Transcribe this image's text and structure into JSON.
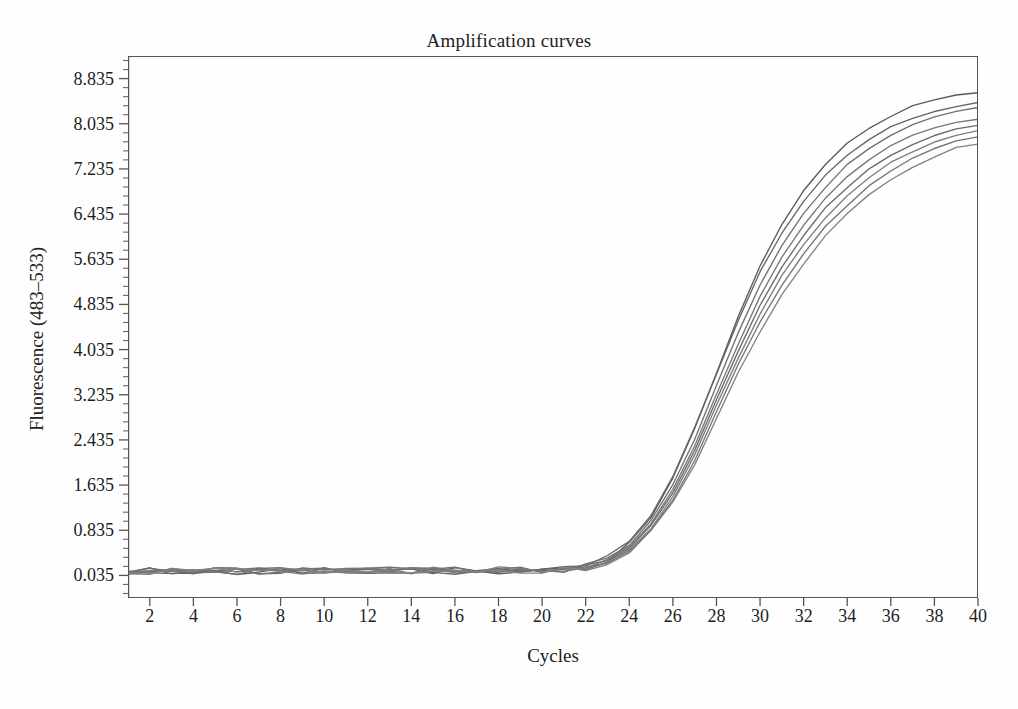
{
  "chart_data": {
    "type": "line",
    "title": "Amplification curves",
    "xlabel": "Cycles",
    "ylabel": "Fluorescence (483–533)",
    "xlim": [
      1,
      40
    ],
    "ylim": [
      -0.365,
      9.235
    ],
    "grid": false,
    "legend": "none",
    "x_ticks": [
      2,
      4,
      6,
      8,
      10,
      12,
      14,
      16,
      18,
      20,
      22,
      24,
      26,
      28,
      30,
      32,
      34,
      36,
      38,
      40
    ],
    "x_tick_labels": [
      "2",
      "4",
      "6",
      "8",
      "10",
      "12",
      "14",
      "16",
      "18",
      "20",
      "22",
      "24",
      "26",
      "28",
      "30",
      "32",
      "34",
      "36",
      "38",
      "40"
    ],
    "x_minor_tick_step": 1,
    "y_ticks": [
      0.035,
      0.835,
      1.635,
      2.435,
      3.235,
      4.035,
      4.835,
      5.635,
      6.435,
      7.235,
      8.035,
      8.835
    ],
    "y_tick_labels": [
      "0.035",
      "0.835",
      "1.635",
      "2.435",
      "3.235",
      "4.035",
      "4.835",
      "5.635",
      "6.435",
      "7.235",
      "8.035",
      "8.835"
    ],
    "y_minor_ticks_per_interval": 5,
    "x": [
      1,
      2,
      3,
      4,
      5,
      6,
      7,
      8,
      9,
      10,
      11,
      12,
      13,
      14,
      15,
      16,
      17,
      18,
      19,
      20,
      21,
      22,
      23,
      24,
      25,
      26,
      27,
      28,
      29,
      30,
      31,
      32,
      33,
      34,
      35,
      36,
      37,
      38,
      39,
      40
    ],
    "series_color": "#6d6d6d",
    "series": [
      {
        "name": "sample-1",
        "color": "#5a5a5a",
        "values": [
          0.12,
          0.11,
          0.1,
          0.12,
          0.11,
          0.09,
          0.12,
          0.13,
          0.11,
          0.1,
          0.12,
          0.13,
          0.11,
          0.12,
          0.1,
          0.13,
          0.12,
          0.11,
          0.13,
          0.12,
          0.14,
          0.18,
          0.32,
          0.62,
          1.08,
          1.75,
          2.62,
          3.62,
          4.62,
          5.52,
          6.25,
          6.85,
          7.32,
          7.68,
          7.96,
          8.18,
          8.34,
          8.47,
          8.56,
          8.6
        ]
      },
      {
        "name": "sample-2",
        "color": "#666666",
        "values": [
          0.11,
          0.12,
          0.11,
          0.1,
          0.12,
          0.11,
          0.1,
          0.12,
          0.12,
          0.11,
          0.13,
          0.11,
          0.12,
          0.13,
          0.11,
          0.12,
          0.13,
          0.12,
          0.11,
          0.13,
          0.15,
          0.2,
          0.34,
          0.64,
          1.1,
          1.78,
          2.64,
          3.6,
          4.55,
          5.4,
          6.08,
          6.66,
          7.12,
          7.48,
          7.76,
          7.98,
          8.14,
          8.26,
          8.35,
          8.4
        ]
      },
      {
        "name": "sample-3",
        "color": "#707070",
        "values": [
          0.1,
          0.11,
          0.12,
          0.11,
          0.1,
          0.12,
          0.11,
          0.11,
          0.13,
          0.12,
          0.11,
          0.12,
          0.13,
          0.11,
          0.12,
          0.13,
          0.11,
          0.13,
          0.12,
          0.12,
          0.14,
          0.19,
          0.31,
          0.58,
          1.0,
          1.64,
          2.46,
          3.4,
          4.34,
          5.18,
          5.88,
          6.45,
          6.92,
          7.3,
          7.6,
          7.84,
          8.02,
          8.16,
          8.26,
          8.32
        ]
      },
      {
        "name": "sample-4",
        "color": "#787878",
        "values": [
          0.12,
          0.1,
          0.11,
          0.12,
          0.11,
          0.13,
          0.12,
          0.1,
          0.12,
          0.13,
          0.12,
          0.11,
          0.12,
          0.12,
          0.13,
          0.11,
          0.12,
          0.12,
          0.13,
          0.12,
          0.14,
          0.18,
          0.3,
          0.56,
          0.96,
          1.56,
          2.34,
          3.24,
          4.14,
          4.96,
          5.66,
          6.24,
          6.72,
          7.1,
          7.4,
          7.64,
          7.82,
          7.96,
          8.06,
          8.12
        ]
      },
      {
        "name": "sample-5",
        "color": "#6a6a6a",
        "values": [
          0.11,
          0.12,
          0.1,
          0.11,
          0.13,
          0.11,
          0.12,
          0.12,
          0.1,
          0.12,
          0.13,
          0.12,
          0.11,
          0.13,
          0.12,
          0.11,
          0.13,
          0.12,
          0.12,
          0.13,
          0.15,
          0.19,
          0.29,
          0.54,
          0.92,
          1.5,
          2.26,
          3.14,
          4.02,
          4.82,
          5.5,
          6.06,
          6.54,
          6.92,
          7.24,
          7.48,
          7.68,
          7.82,
          7.94,
          8.02
        ]
      },
      {
        "name": "sample-6",
        "color": "#7e7e7e",
        "values": [
          0.12,
          0.11,
          0.12,
          0.1,
          0.12,
          0.12,
          0.11,
          0.13,
          0.11,
          0.12,
          0.11,
          0.13,
          0.12,
          0.11,
          0.13,
          0.12,
          0.11,
          0.13,
          0.12,
          0.13,
          0.14,
          0.18,
          0.28,
          0.52,
          0.88,
          1.44,
          2.18,
          3.04,
          3.9,
          4.68,
          5.34,
          5.9,
          6.38,
          6.76,
          7.08,
          7.34,
          7.54,
          7.7,
          7.82,
          7.9
        ]
      },
      {
        "name": "sample-7",
        "color": "#747474",
        "values": [
          0.1,
          0.12,
          0.11,
          0.13,
          0.11,
          0.1,
          0.13,
          0.11,
          0.12,
          0.13,
          0.12,
          0.12,
          0.11,
          0.12,
          0.12,
          0.13,
          0.12,
          0.11,
          0.13,
          0.12,
          0.13,
          0.17,
          0.27,
          0.5,
          0.85,
          1.38,
          2.08,
          2.92,
          3.76,
          4.52,
          5.18,
          5.74,
          6.22,
          6.6,
          6.94,
          7.2,
          7.42,
          7.58,
          7.72,
          7.8
        ]
      },
      {
        "name": "sample-8",
        "color": "#828282",
        "values": [
          0.11,
          0.11,
          0.12,
          0.11,
          0.12,
          0.12,
          0.11,
          0.12,
          0.13,
          0.11,
          0.12,
          0.12,
          0.13,
          0.12,
          0.11,
          0.12,
          0.13,
          0.12,
          0.12,
          0.12,
          0.13,
          0.17,
          0.26,
          0.48,
          0.82,
          1.32,
          2.0,
          2.8,
          3.62,
          4.36,
          5.0,
          5.56,
          6.04,
          6.44,
          6.78,
          7.06,
          7.28,
          7.46,
          7.6,
          7.68
        ]
      }
    ],
    "vertical_markers": [
      {
        "name": "cycle-1-marker",
        "x": 1,
        "color": "#3a3a3a"
      },
      {
        "name": "cycle-40-marker",
        "x": 40,
        "color": "#8a8a8a"
      }
    ]
  }
}
